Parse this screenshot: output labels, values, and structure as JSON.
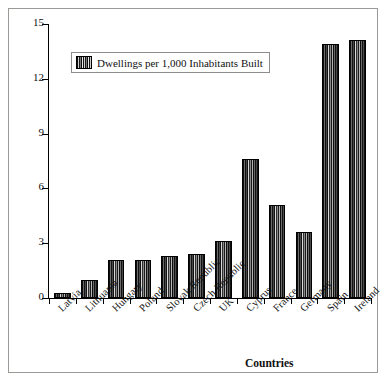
{
  "chart_data": {
    "type": "bar",
    "title": "",
    "xlabel": "Countries",
    "ylabel": "",
    "ylim": [
      0,
      15
    ],
    "yticks": [
      0,
      3,
      6,
      9,
      12,
      15
    ],
    "grid": false,
    "legend_position": "top-left-inside",
    "legend": [
      "Dwellings per 1,000 Inhabitants Built"
    ],
    "categories": [
      "Latvia",
      "Lithuania",
      "Hungary",
      "Poland",
      "Slovak Republic",
      "Czech Republic",
      "UK",
      "Cyprus",
      "France",
      "Germany",
      "Spain",
      "Ireland"
    ],
    "series": [
      {
        "name": "Dwellings per 1,000 Inhabitants Built",
        "values": [
          0.3,
          1.0,
          2.1,
          2.1,
          2.3,
          2.4,
          3.1,
          7.6,
          5.1,
          3.6,
          13.9,
          14.1
        ]
      }
    ]
  },
  "legend": {
    "label": "Dwellings per 1,000 Inhabitants Built",
    "swatch_icon": "striped-bar-swatch"
  },
  "axes": {
    "x_title": "Countries",
    "y_tick_labels": [
      "0",
      "3",
      "6",
      "9",
      "12",
      "15"
    ]
  },
  "colors": {
    "frame_border": "#9a9a96",
    "axis": "#000000",
    "bar_dark": "#0d0d0d",
    "bar_light": "#d8d8d8",
    "background": "#ffffff",
    "text": "#111111"
  }
}
